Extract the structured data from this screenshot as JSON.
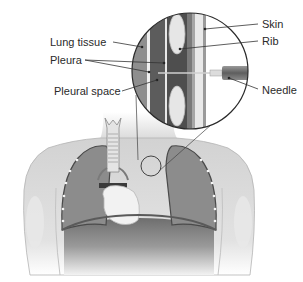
{
  "diagram": {
    "labels": {
      "lung_tissue": "Lung tissue",
      "pleura": "Pleura",
      "pleural_space": "Pleural space",
      "skin": "Skin",
      "rib": "Rib",
      "needle": "Needle"
    },
    "colors": {
      "background": "#ffffff",
      "body": "#dcdcdc",
      "body_outline": "#a8a8a8",
      "lung": "#8a8a8a",
      "lung_dark": "#6a6a6a",
      "heart": "#f0f0f0",
      "diaphragm": "#7a7a7a",
      "leader_line": "#3a3a3a",
      "circle_outline": "#2a2a2a"
    }
  }
}
